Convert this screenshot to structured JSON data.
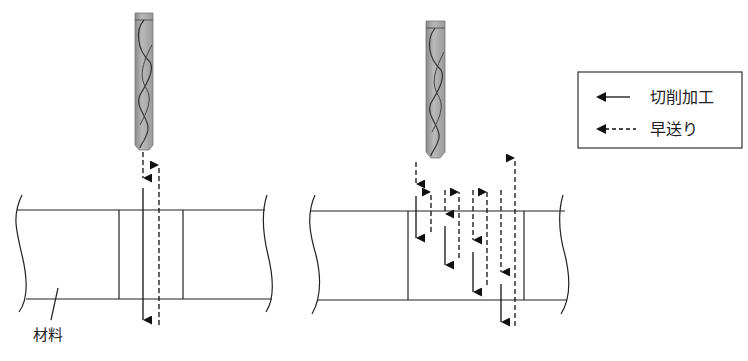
{
  "figure": {
    "material_label": "材料",
    "legend": {
      "items": [
        {
          "line": "solid",
          "label": "切削加工"
        },
        {
          "line": "dashed",
          "label": "早送り"
        }
      ]
    },
    "left_diagram": {
      "description": "single plunge: rapid down, cut through, rapid up",
      "tool": "end-mill-icon"
    },
    "right_diagram": {
      "description": "peck drilling: repeated rapid/cut steps increasing depth",
      "tool": "end-mill-icon"
    }
  }
}
